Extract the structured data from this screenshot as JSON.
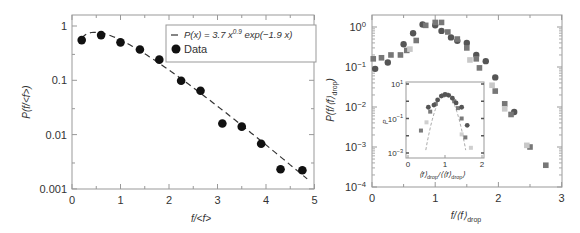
{
  "chart_data": [
    {
      "type": "scatter",
      "panel": "left",
      "xlabel": "f/<f>",
      "ylabel": "P(f/<f>)",
      "xlim": [
        0,
        5
      ],
      "ylim": [
        0.001,
        1.5
      ],
      "yscale": "log",
      "x_ticks": [
        "0",
        "1",
        "2",
        "3",
        "4",
        "5"
      ],
      "y_ticks": [
        "0.001",
        "0.01",
        "0.1",
        "1"
      ],
      "legend": {
        "position": "upper right",
        "entries": [
          {
            "label": "P(x) = 3.7 x^0.9 exp(-1.9 x)",
            "style": "dashed-line"
          },
          {
            "label": "Data",
            "style": "filled-circle"
          }
        ]
      },
      "series": [
        {
          "name": "Data",
          "marker": "circle",
          "color": "#111111",
          "x": [
            0.2,
            0.6,
            1.0,
            1.4,
            1.8,
            2.25,
            2.65,
            3.1,
            3.5,
            3.9,
            4.3,
            4.75
          ],
          "y": [
            0.55,
            0.68,
            0.5,
            0.37,
            0.24,
            0.098,
            0.064,
            0.016,
            0.014,
            0.0068,
            0.0023,
            0.0022
          ]
        },
        {
          "name": "P(x) = 3.7 x^0.9 exp(-1.9 x)",
          "type": "line",
          "style": "dashed",
          "color": "#333333",
          "formula": {
            "a": 3.7,
            "b": 0.9,
            "c": 1.9
          },
          "x_range": [
            0.2,
            4.85
          ]
        }
      ]
    },
    {
      "type": "scatter",
      "panel": "right",
      "xlabel": "f/⟨f⟩drop",
      "ylabel": "P(f/⟨f⟩drop)",
      "xlim": [
        0,
        3
      ],
      "ylim": [
        0.0001,
        2
      ],
      "yscale": "log",
      "x_ticks": [
        "0",
        "1",
        "2",
        "3"
      ],
      "y_ticks": [
        "10^-4",
        "10^-3",
        "10^-2",
        "10^-1",
        "10^0"
      ],
      "series": [
        {
          "name": "circles",
          "marker": "circle",
          "color": "#555555",
          "x": [
            0.05,
            0.25,
            0.5,
            0.65,
            0.8,
            1.0,
            1.1,
            1.25,
            1.35,
            1.5,
            1.65,
            1.8,
            1.95,
            2.25
          ],
          "y": [
            0.09,
            0.13,
            0.37,
            0.7,
            1.15,
            1.1,
            0.8,
            0.55,
            0.45,
            0.4,
            0.2,
            0.14,
            0.055,
            0.0075
          ]
        },
        {
          "name": "dark-squares",
          "marker": "square",
          "color": "#777777",
          "x": [
            0.02,
            0.15,
            0.3,
            0.45,
            0.55,
            0.7,
            0.85,
            1.0,
            1.1,
            1.2,
            1.35,
            1.5,
            1.65,
            1.7,
            1.95,
            2.1,
            2.2,
            2.5,
            2.75
          ],
          "y": [
            0.16,
            0.17,
            0.2,
            0.2,
            0.26,
            0.46,
            1.1,
            1.3,
            1.3,
            0.75,
            0.5,
            0.3,
            0.16,
            0.095,
            0.025,
            0.012,
            0.0065,
            0.001,
            0.00035
          ]
        },
        {
          "name": "light-squares",
          "marker": "square",
          "color": "#c8c8c8",
          "x": [
            0.6,
            1.55,
            1.9,
            2.1,
            2.45
          ],
          "y": [
            0.28,
            0.15,
            0.035,
            0.009,
            0.0011
          ]
        }
      ],
      "inset": {
        "xlabel": "⟨f⟩drop/⟨⟨f⟩drop⟩",
        "ylabel": "P",
        "xlim": [
          0,
          2
        ],
        "ylim": [
          0.001,
          10
        ],
        "yscale": "log",
        "x_ticks": [
          "0",
          "1",
          "2"
        ],
        "y_ticks": [
          "10^-3",
          "10^-1",
          "10^1"
        ],
        "points_dark": {
          "x": [
            0.55,
            0.7,
            0.8,
            0.9,
            1.0,
            1.1,
            1.2,
            1.3,
            1.45,
            1.6
          ],
          "y": [
            0.45,
            0.6,
            1.2,
            2.0,
            2.5,
            2.2,
            1.5,
            0.8,
            0.45,
            0.04
          ]
        },
        "points_mid": {
          "x": [
            0.35,
            0.6,
            0.75,
            0.95,
            1.05,
            1.25,
            1.35,
            1.45,
            1.55
          ],
          "y": [
            0.02,
            0.25,
            0.7,
            2.2,
            2.4,
            1.0,
            0.4,
            0.1,
            0.008
          ]
        },
        "points_light": {
          "x": [
            0.5,
            1.45,
            1.7
          ],
          "y": [
            0.06,
            0.012,
            0.002
          ]
        },
        "fit_style": "dashed"
      }
    }
  ]
}
